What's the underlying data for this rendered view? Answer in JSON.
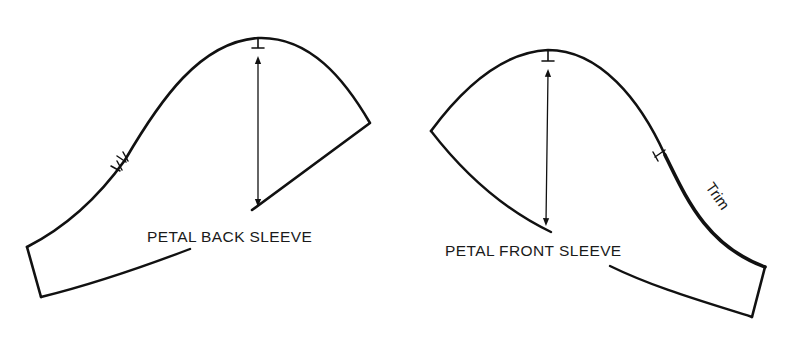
{
  "diagram": {
    "type": "sewing-pattern",
    "pieces": [
      {
        "id": "back",
        "label": "PETAL BACK SLEEVE",
        "markings": [
          "top-notch",
          "double-notch",
          "grainline-arrow"
        ]
      },
      {
        "id": "front",
        "label": "PETAL FRONT SLEEVE",
        "markings": [
          "top-notch",
          "single-notch",
          "grainline-arrow"
        ],
        "annotation": "Trim"
      }
    ],
    "colors": {
      "line": "#111111",
      "background": "#ffffff"
    }
  }
}
